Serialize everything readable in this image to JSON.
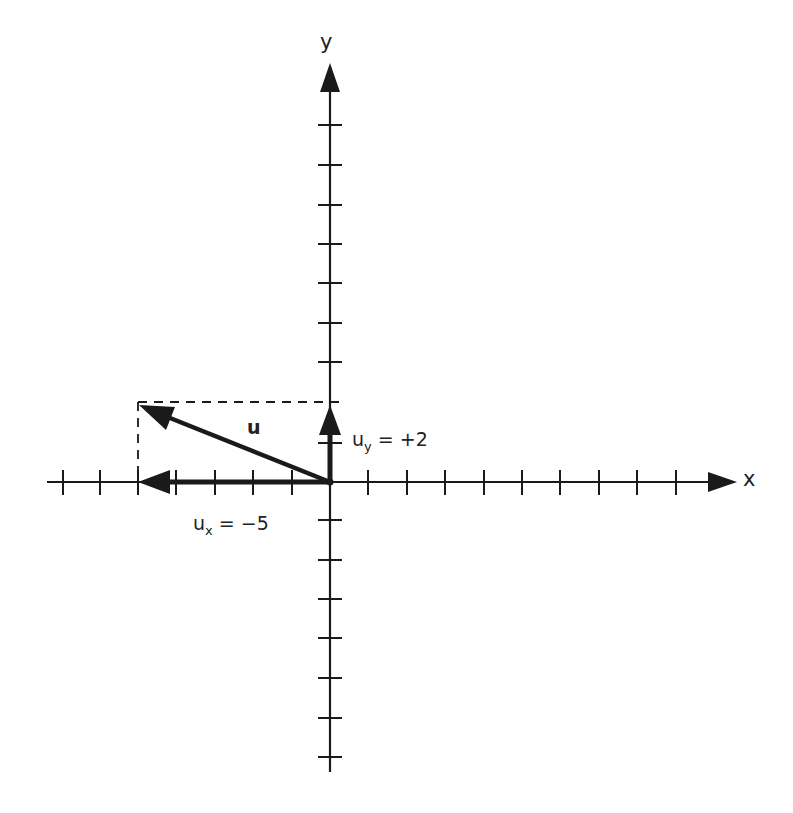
{
  "diagram": {
    "type": "vector-components",
    "axes": {
      "x_label": "x",
      "y_label": "y",
      "origin_px": [
        330,
        482
      ],
      "tick_spacing_px": 38.7,
      "x_ticks_negative": 7,
      "x_ticks_positive": 9,
      "y_ticks_positive": 9,
      "y_ticks_negative": 7
    },
    "vector": {
      "name": "u",
      "components": {
        "x": -5,
        "y": 2
      }
    },
    "labels": {
      "vector_label": "u",
      "ux_base": "u",
      "ux_sub": "x",
      "ux_value": " = −5",
      "uy_base": "u",
      "uy_sub": "y",
      "uy_value": " = +2"
    },
    "colors": {
      "ink": "#1a1a1a",
      "background": "#ffffff"
    }
  }
}
